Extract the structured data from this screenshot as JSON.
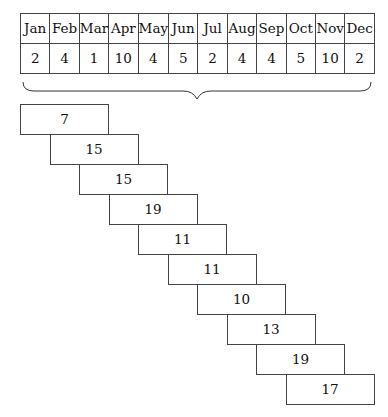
{
  "table": {
    "months": [
      "Jan",
      "Feb",
      "Mar",
      "Apr",
      "May",
      "Jun",
      "Jul",
      "Aug",
      "Sep",
      "Oct",
      "Nov",
      "Dec"
    ],
    "values": [
      "2",
      "4",
      "1",
      "10",
      "4",
      "5",
      "2",
      "4",
      "4",
      "5",
      "10",
      "2"
    ]
  },
  "windows": {
    "window_size": 3,
    "sums": [
      "7",
      "15",
      "15",
      "19",
      "11",
      "11",
      "10",
      "13",
      "19",
      "17"
    ]
  }
}
